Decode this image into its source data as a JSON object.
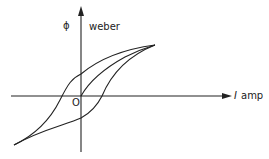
{
  "diagram": {
    "y_axis": {
      "symbol": "ϕ",
      "unit": "weber"
    },
    "x_axis": {
      "symbol": "I",
      "unit": "amp"
    },
    "origin_label": "O",
    "colors": {
      "stroke": "#222222",
      "background": "#ffffff"
    }
  }
}
